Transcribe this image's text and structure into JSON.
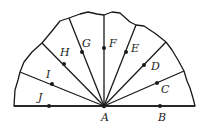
{
  "diagram": {
    "center": {
      "label": "A",
      "x": 104,
      "y": 106,
      "label_x": 101,
      "label_y": 121
    },
    "stroke_color": "#1a1a1a",
    "outline_path": "M14,106 L15,90 L18,80 L20,72 L24,62 L32,52 L42,43 L52,31 L60,21 L69,18 L80,14 L88,12 L97,14 L104,15 L112,12 L120,13 L130,22 L136,25 L144,26 L156,34 L166,42 L172,50 L178,60 L184,71 L187,81 L190,88 L193,98 L195,106 Z",
    "points": [
      {
        "label": "B",
        "x": 160,
        "y": 106,
        "end_x": 195,
        "end_y": 106,
        "label_x": 158,
        "label_y": 121
      },
      {
        "label": "C",
        "x": 157,
        "y": 83,
        "end_x": 184,
        "end_y": 71,
        "label_x": 161,
        "label_y": 93
      },
      {
        "label": "D",
        "x": 144,
        "y": 65,
        "end_x": 166,
        "end_y": 42,
        "label_x": 151,
        "label_y": 70
      },
      {
        "label": "E",
        "x": 126,
        "y": 52,
        "end_x": 136,
        "end_y": 25,
        "label_x": 131,
        "label_y": 52
      },
      {
        "label": "F",
        "x": 104,
        "y": 48,
        "end_x": 104,
        "end_y": 15,
        "label_x": 109,
        "label_y": 47
      },
      {
        "label": "G",
        "x": 82,
        "y": 52,
        "end_x": 69,
        "end_y": 18,
        "label_x": 82,
        "label_y": 47
      },
      {
        "label": "H",
        "x": 64,
        "y": 64,
        "end_x": 42,
        "end_y": 43,
        "label_x": 60,
        "label_y": 56
      },
      {
        "label": "I",
        "x": 52,
        "y": 84,
        "end_x": 20,
        "end_y": 72,
        "label_x": 46,
        "label_y": 78
      },
      {
        "label": "J",
        "x": 49,
        "y": 106,
        "end_x": 14,
        "end_y": 106,
        "label_x": 38,
        "label_y": 101
      }
    ]
  }
}
